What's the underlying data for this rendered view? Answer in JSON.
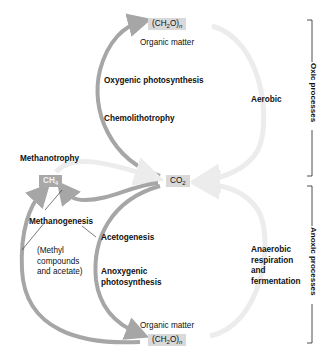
{
  "nodes": {
    "organic_top": {
      "formula_prefix": "(CH",
      "sub1": "2",
      "formula_mid": "O)",
      "sub2": "n",
      "caption": "Organic matter"
    },
    "co2": {
      "formula_prefix": "CO",
      "sub1": "2"
    },
    "ch4": {
      "formula_prefix": "CH",
      "sub1": "4"
    },
    "organic_bottom": {
      "formula_prefix": "(CH",
      "sub1": "2",
      "formula_mid": "O)",
      "sub2": "n",
      "caption": "Organic matter"
    }
  },
  "processes": {
    "oxygenic_photosynthesis": "Oxygenic photosynthesis",
    "chemolithotrophy": "Chemolithotrophy",
    "aerobic": "Aerobic",
    "methanotrophy": "Methanotrophy",
    "methanogenesis": "Methanogenesis",
    "methyl_note": [
      "(Methyl",
      "compounds",
      "and acetate)"
    ],
    "acetogenesis": "Acetogenesis",
    "anoxygenic_photosynthesis": [
      "Anoxygenic",
      "photosynthesis"
    ],
    "anaerobic": [
      "Anaerobic",
      "respiration",
      "and",
      "fermentation"
    ]
  },
  "brackets": {
    "oxic": "Oxic processes",
    "anoxic": "Anoxic processes"
  },
  "colors": {
    "arrow_dark": "#a6a6a6",
    "arrow_light": "#ececec",
    "box_light": "#d9d9d9",
    "box_dark": "#a8a8a8"
  }
}
